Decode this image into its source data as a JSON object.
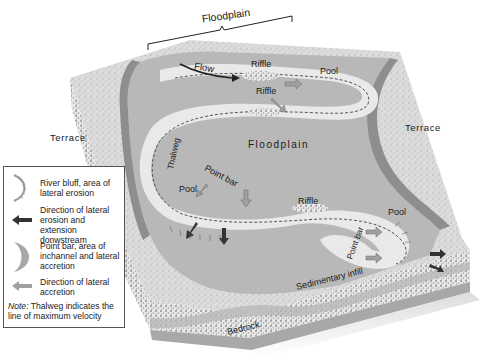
{
  "diagram": {
    "labels": {
      "floodplain_top": "Floodplain",
      "floodplain_center": "Floodplain",
      "flow": "Flow",
      "riffle_top": "Riffle",
      "riffle_middle": "Riffle",
      "riffle_lower": "Riffle",
      "pool_upper_right": "Pool",
      "pool_left": "Pool",
      "pool_lower_right": "Pool",
      "terrace_left": "Terrace",
      "terrace_right": "Terrace",
      "thalweg": "Thalweg",
      "point_bar_center": "Point bar",
      "point_bar_right": "Point bar",
      "sedimentary_infill": "Sedimentary infill",
      "bedrock": "Bedrock"
    },
    "colors": {
      "terrace": "#d6d6d6",
      "floodplain": "#b4b4b4",
      "channel": "#e6e6e6",
      "bluff": "#9a9a9a",
      "gravel": "#c8c8c8",
      "bedrock": "#a8a8a8",
      "erosion_arrow": "#333333",
      "accretion_arrow": "#9a9a9a"
    }
  },
  "legend": {
    "items": [
      {
        "icon": "river-bluff-icon",
        "text": "River bluff, area of lateral erosion"
      },
      {
        "icon": "dark-arrow-icon",
        "text": "Direction of lateral erosion and extension donwstream"
      },
      {
        "icon": "point-bar-crescent-icon",
        "text": "Point bar, area of inchannel and lateral accretion"
      },
      {
        "icon": "light-arrow-icon",
        "text": "Direction of lateral accretion"
      }
    ],
    "note_label": "Note:",
    "note_text": " Thalweg indicates the line of maximum velocity"
  }
}
